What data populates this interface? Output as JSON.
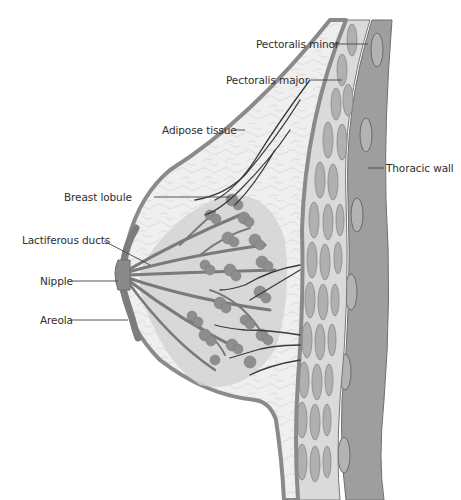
{
  "figure": {
    "colors": {
      "background": "#ffffff",
      "skin": "#8a8a8a",
      "adipose": "#ededed",
      "glandular": "#c4c4c4",
      "lobule": "#8e8e8e",
      "duct": "#7a7a7a",
      "muscle": "#a9a9a9",
      "thoracic_wall": "#9c9c9c",
      "vessel": "#3a3a3a",
      "leader_line": "#444444",
      "label_text": "#2e2e2e"
    }
  },
  "labels": {
    "pectoralis_minor": "Pectoralis minor",
    "pectoralis_major": "Pectoralis major",
    "adipose_tissue": "Adipose tissue",
    "breast_lobule": "Breast lobule",
    "lactiferous_ducts": "Lactiferous ducts",
    "nipple": "Nipple",
    "areola": "Areola",
    "thoracic_wall": "Thoracic wall"
  }
}
